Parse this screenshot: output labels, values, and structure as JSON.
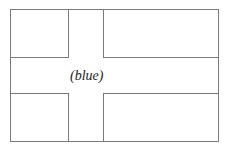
{
  "diagram": {
    "type": "flag-outline",
    "cross_label": "(blue)",
    "line_color": "#7a7a7a"
  }
}
